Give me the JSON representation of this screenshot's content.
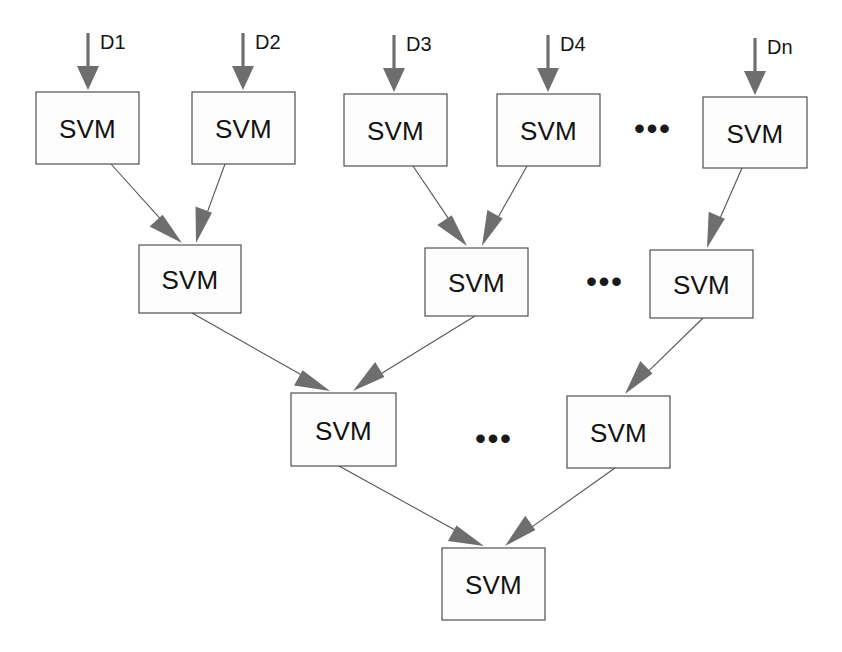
{
  "figure": {
    "background_color": "#ffffff",
    "box_fill": "#fdfdfd",
    "box_stroke": "#4a4a4a",
    "edge_color": "#555555",
    "arrow_color": "#6e6e6e",
    "text_color": "#121212"
  },
  "node_label": "SVM",
  "levels": [
    {
      "name": "level-1-inputs",
      "nodes": [
        {
          "id": "l1n1",
          "label": "SVM",
          "x": 36,
          "y": 92,
          "w": 103,
          "h": 72
        },
        {
          "id": "l1n2",
          "label": "SVM",
          "x": 192,
          "y": 92,
          "w": 103,
          "h": 72
        },
        {
          "id": "l1n3",
          "label": "SVM",
          "x": 344,
          "y": 94,
          "w": 103,
          "h": 72
        },
        {
          "id": "l1n4",
          "label": "SVM",
          "x": 497,
          "y": 94,
          "w": 103,
          "h": 72
        },
        {
          "id": "l1n5",
          "label": "SVM",
          "x": 703,
          "y": 97,
          "w": 104,
          "h": 71
        }
      ]
    },
    {
      "name": "level-2",
      "nodes": [
        {
          "id": "l2n1",
          "label": "SVM",
          "x": 139,
          "y": 245,
          "w": 102,
          "h": 68
        },
        {
          "id": "l2n2",
          "label": "SVM",
          "x": 425,
          "y": 248,
          "w": 103,
          "h": 68
        },
        {
          "id": "l2n3",
          "label": "SVM",
          "x": 650,
          "y": 250,
          "w": 103,
          "h": 68
        }
      ]
    },
    {
      "name": "level-3",
      "nodes": [
        {
          "id": "l3n1",
          "label": "SVM",
          "x": 291,
          "y": 393,
          "w": 105,
          "h": 73
        },
        {
          "id": "l3n2",
          "label": "SVM",
          "x": 567,
          "y": 396,
          "w": 103,
          "h": 72
        }
      ]
    },
    {
      "name": "level-4-output",
      "nodes": [
        {
          "id": "l4n1",
          "label": "SVM",
          "x": 442,
          "y": 548,
          "w": 103,
          "h": 72
        }
      ]
    }
  ],
  "inputs": [
    {
      "id": "d1",
      "label": "D1",
      "shaft_x": 88,
      "shaft_y1": 33,
      "shaft_y2": 68,
      "tip_y": 90,
      "label_x": 100,
      "label_y": 42
    },
    {
      "id": "d2",
      "label": "D2",
      "shaft_x": 243,
      "shaft_y1": 33,
      "shaft_y2": 68,
      "tip_y": 90,
      "label_x": 255,
      "label_y": 42
    },
    {
      "id": "d3",
      "label": "D3",
      "shaft_x": 394,
      "shaft_y1": 35,
      "shaft_y2": 70,
      "tip_y": 92,
      "label_x": 406,
      "label_y": 44
    },
    {
      "id": "d4",
      "label": "D4",
      "shaft_x": 548,
      "shaft_y1": 35,
      "shaft_y2": 70,
      "tip_y": 92,
      "label_x": 560,
      "label_y": 44
    },
    {
      "id": "dn",
      "label": "Dn",
      "shaft_x": 755,
      "shaft_y1": 38,
      "shaft_y2": 73,
      "tip_y": 95,
      "label_x": 767,
      "label_y": 47
    }
  ],
  "edges": [
    {
      "id": "e1",
      "from": "l1n1",
      "to": "l2n1",
      "x1": 111,
      "y1": 164,
      "x2": 182,
      "y2": 243
    },
    {
      "id": "e2",
      "from": "l1n2",
      "to": "l2n1",
      "x1": 225,
      "y1": 164,
      "x2": 196,
      "y2": 243
    },
    {
      "id": "e3",
      "from": "l1n3",
      "to": "l2n2",
      "x1": 413,
      "y1": 166,
      "x2": 467,
      "y2": 246
    },
    {
      "id": "e4",
      "from": "l1n4",
      "to": "l2n2",
      "x1": 527,
      "y1": 166,
      "x2": 482,
      "y2": 246
    },
    {
      "id": "e5",
      "from": "l1n5",
      "to": "l2n3",
      "x1": 742,
      "y1": 168,
      "x2": 707,
      "y2": 248
    },
    {
      "id": "e6",
      "from": "l2n1",
      "to": "l3n1",
      "x1": 192,
      "y1": 313,
      "x2": 330,
      "y2": 391
    },
    {
      "id": "e7",
      "from": "l2n2",
      "to": "l3n1",
      "x1": 475,
      "y1": 316,
      "x2": 353,
      "y2": 391
    },
    {
      "id": "e8",
      "from": "l2n3",
      "to": "l3n2",
      "x1": 703,
      "y1": 318,
      "x2": 625,
      "y2": 394
    },
    {
      "id": "e9",
      "from": "l3n1",
      "to": "l4n1",
      "x1": 339,
      "y1": 466,
      "x2": 484,
      "y2": 546
    },
    {
      "id": "e10",
      "from": "l3n2",
      "to": "l4n1",
      "x1": 615,
      "y1": 468,
      "x2": 505,
      "y2": 546
    }
  ],
  "ellipses": [
    {
      "id": "ellipsis-level-1",
      "label": "•••",
      "x": 653,
      "y": 128
    },
    {
      "id": "ellipsis-level-2",
      "label": "•••",
      "x": 605,
      "y": 281
    },
    {
      "id": "ellipsis-level-3",
      "label": "•••",
      "x": 494,
      "y": 438
    }
  ],
  "chart_data": {
    "type": "diagram",
    "levels": 4,
    "node_counts_per_level": [
      5,
      3,
      2,
      1
    ],
    "node_label": "SVM",
    "input_labels": [
      "D1",
      "D2",
      "D3",
      "D4",
      "Dn"
    ],
    "ellipsis_count": 3,
    "edge_count": 10
  }
}
